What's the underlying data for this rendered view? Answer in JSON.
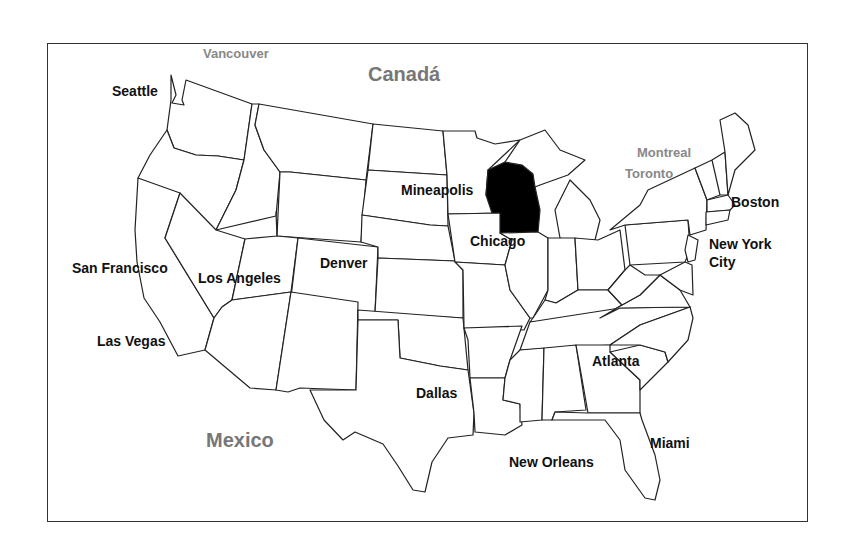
{
  "map": {
    "title": "United States map with Wisconsin highlighted",
    "highlighted_state": "Wisconsin",
    "highlight_color": "#000000",
    "outline_color": "#222222",
    "countries": [
      {
        "name": "Canadá",
        "x": 368,
        "y": 64
      },
      {
        "name": "Mexico",
        "x": 206,
        "y": 430
      }
    ],
    "foreign_cities": [
      {
        "name": "Vancouver",
        "x": 203,
        "y": 47
      },
      {
        "name": "Montreal",
        "x": 637,
        "y": 146
      },
      {
        "name": "Toronto",
        "x": 625,
        "y": 167
      }
    ],
    "cities": [
      {
        "name": "Seattle",
        "x": 112,
        "y": 84
      },
      {
        "name": "San Francisco",
        "x": 72,
        "y": 261
      },
      {
        "name": "Los Angeles",
        "x": 198,
        "y": 271
      },
      {
        "name": "Las Vegas",
        "x": 97,
        "y": 334
      },
      {
        "name": "Denver",
        "x": 320,
        "y": 256
      },
      {
        "name": "Mineapolis",
        "x": 401,
        "y": 183
      },
      {
        "name": "Chicago",
        "x": 470,
        "y": 234
      },
      {
        "name": "Dallas",
        "x": 416,
        "y": 386
      },
      {
        "name": "New Orleans",
        "x": 509,
        "y": 455
      },
      {
        "name": "Atlanta",
        "x": 592,
        "y": 354
      },
      {
        "name": "Miami",
        "x": 650,
        "y": 436
      },
      {
        "name": "Boston",
        "x": 731,
        "y": 195
      },
      {
        "name": "New York",
        "x": 709,
        "y": 237
      },
      {
        "name": "City",
        "x": 709,
        "y": 255
      }
    ]
  }
}
